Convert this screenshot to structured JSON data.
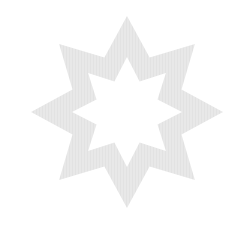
{
  "figure": {
    "shape": "eight-pointed-star-outline",
    "fill_color": "#e8e8e8",
    "stripe_color": "#dcdcdc",
    "background": "#ffffff",
    "center": [
      127,
      112
    ],
    "outer_tip_radius": 96,
    "outer_valley_radius": 59,
    "inner_tip_radius": 55,
    "inner_valley_radius": 33,
    "points": 8
  }
}
